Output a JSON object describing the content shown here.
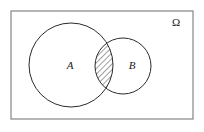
{
  "figure": {
    "type": "venn-diagram",
    "background_color": "#ffffff",
    "stroke_color": "#2b2b2b",
    "rect_stroke_color": "#7a7a7a",
    "hatch_color": "#2b2b2b"
  },
  "universe": {
    "label": "Ω",
    "label_name": "omega-universal-set-label",
    "rect": {
      "x": 11,
      "y": 11,
      "width": 182,
      "height": 108
    },
    "label_position": {
      "x": 176,
      "y": 26
    }
  },
  "sets": [
    {
      "id": "A",
      "label": "A",
      "cx": 71,
      "cy": 65,
      "r": 42,
      "label_position": {
        "x": 70,
        "y": 69
      },
      "filled": false
    },
    {
      "id": "B",
      "label": "B",
      "cx": 123,
      "cy": 66,
      "r": 28,
      "label_position": {
        "x": 132,
        "y": 69
      },
      "filled": false
    }
  ],
  "shaded_region": {
    "name": "intersection-A-and-B",
    "notation": "A ∩ B",
    "pattern": "diagonal-hatch",
    "hatch_angle_degrees": 45,
    "hatch_spacing_px": 4,
    "hatch_stroke_width": 0.9
  }
}
